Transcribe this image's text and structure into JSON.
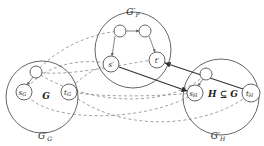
{
  "diagram": {
    "colors": {
      "stroke": "#555555",
      "dashed": "#8a8a8a",
      "solid_edge": "#333333",
      "background": "#ffffff"
    },
    "regions": [
      {
        "id": "G_prime_P",
        "label": "G′",
        "sub": "P",
        "cx": 133,
        "cy": 50,
        "r": 38,
        "lx": 133,
        "ly": 15
      },
      {
        "id": "G_prime_G",
        "label": "G′",
        "sub": "G",
        "cx": 42,
        "cy": 97,
        "r": 36,
        "lx": 45,
        "ly": 139,
        "inner_label": "G",
        "ix": 46,
        "iy": 99
      },
      {
        "id": "G_prime_H",
        "label": "G′",
        "sub": "H",
        "cx": 221,
        "cy": 97,
        "r": 38,
        "lx": 218,
        "ly": 139,
        "inner_label": "H ⊆ G",
        "ix": 223,
        "iy": 97
      }
    ],
    "nodes": [
      {
        "id": "p1",
        "label": "",
        "x": 120,
        "y": 31,
        "r": 6
      },
      {
        "id": "p2",
        "label": "",
        "x": 145,
        "y": 31,
        "r": 6
      },
      {
        "id": "s_prime",
        "label": "s′",
        "x": 111,
        "y": 64,
        "r": 8
      },
      {
        "id": "t_prime",
        "label": "t′",
        "x": 157,
        "y": 60,
        "r": 8
      },
      {
        "id": "g1",
        "label": "",
        "x": 36,
        "y": 72,
        "r": 6
      },
      {
        "id": "s_G",
        "label": "s",
        "sub": "G",
        "x": 24,
        "y": 92,
        "r": 8
      },
      {
        "id": "t_G",
        "label": "t",
        "sub": "G",
        "x": 69,
        "y": 92,
        "r": 8
      },
      {
        "id": "h1",
        "label": "",
        "x": 206,
        "y": 74,
        "r": 6
      },
      {
        "id": "s_H",
        "label": "s",
        "sub": "H",
        "x": 195,
        "y": 93,
        "r": 8
      },
      {
        "id": "t_H",
        "label": "t",
        "sub": "H",
        "x": 251,
        "y": 93,
        "r": 9
      }
    ],
    "solid_edges": [
      {
        "from": "s_prime",
        "to": "s_H",
        "arrow": true
      },
      {
        "from": "t_H",
        "to": "t_prime",
        "arrow": true
      }
    ]
  }
}
